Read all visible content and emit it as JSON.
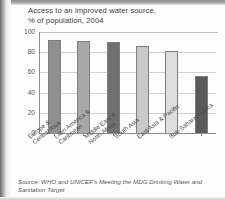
{
  "figure": {
    "title_line1": "Access to an improved water source,",
    "title_line2": "% of population, 2004",
    "source_line1": "Source: WHO and UNICEF's Meeting the MDG Drinking Water and",
    "source_line2": "Sanitation Target"
  },
  "chart_data": {
    "type": "bar",
    "title": "Access to an improved water source, % of population, 2004",
    "xlabel": "",
    "ylabel": "% of population",
    "ylim": [
      0,
      100
    ],
    "yticks": [
      0,
      20,
      40,
      60,
      80,
      100
    ],
    "grid": true,
    "legend": "none",
    "categories": [
      "Europe & Central Asia",
      "Latin America & Caribbean",
      "Middle East & North Africa",
      "South Asia",
      "East Asia & Pacific",
      "Sub-Saharan Africa"
    ],
    "category_lines": [
      [
        "Europe &",
        "Central Asia"
      ],
      [
        "Latin America &",
        "Caribbean"
      ],
      [
        "Middle East &",
        "North Africa"
      ],
      [
        "South Asia"
      ],
      [
        "East Asia & Pacific"
      ],
      [
        "Sub-Saharan Africa"
      ]
    ],
    "values": [
      92,
      91,
      90,
      86,
      81,
      56
    ],
    "bar_colors": [
      "#8f8f8f",
      "#a8a8a8",
      "#6f6f6f",
      "#c9c9c9",
      "#dedede",
      "#5a5a5a"
    ]
  },
  "axis": {
    "tick_100": "100",
    "tick_80": "80",
    "tick_60": "60",
    "tick_40": "40",
    "tick_20": "20",
    "tick_0": "0"
  }
}
